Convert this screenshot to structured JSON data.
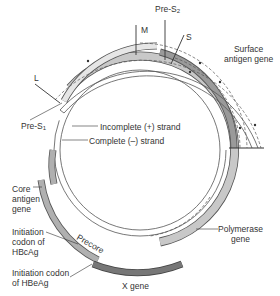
{
  "labels": {
    "m": "M",
    "pre_s2": "Pre-S",
    "pre_s2_sub": "2",
    "s": "S",
    "l": "L",
    "pre_s1": "Pre-S",
    "pre_s1_sub": "1",
    "surface_antigen_gene_line1": "Surface",
    "surface_antigen_gene_line2": "antigen gene",
    "incomplete_strand": "Incomplete (+) strand",
    "complete_strand": "Complete (–) strand",
    "core_antigen_gene_line1": "Core",
    "core_antigen_gene_line2": "antigen",
    "core_antigen_gene_line3": "gene",
    "hbcag_line1": "Initiation",
    "hbcag_line2": "codon of",
    "hbcag_line3": "HBcAg",
    "hbeag_line1": "Initiation codon",
    "hbeag_line2": "of HBeAg",
    "precore": "Precore",
    "polymerase_gene_line1": "Polymerase",
    "polymerase_gene_line2": "gene",
    "x_gene": "X gene"
  },
  "colors": {
    "light_grey": "#c8c8c8",
    "mid_grey": "#a9a9a9",
    "dark_grey": "#7a7a7a",
    "stroke": "#555555",
    "text": "#333333"
  }
}
